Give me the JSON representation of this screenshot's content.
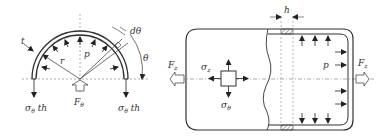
{
  "left_figure": {
    "name": "half-ring-free-body",
    "labels": {
      "t": "t",
      "r": "r",
      "p": "p",
      "dtheta": "dθ",
      "theta": "θ",
      "F_theta": "F",
      "F_theta_sub": "θ",
      "sigma_left": "σ",
      "sigma_left_sub": "θ",
      "sigma_left_suffix": " th",
      "sigma_right": "σ",
      "sigma_right_sub": "θ",
      "sigma_right_suffix": " th"
    }
  },
  "right_figure": {
    "name": "cylinder-section",
    "labels": {
      "h": "h",
      "p": "p",
      "F_z_left": "F",
      "F_z_left_sub": "z",
      "F_z_right": "F",
      "F_z_right_sub": "z",
      "sigma_z": "σ",
      "sigma_z_sub": "z",
      "sigma_theta": "σ",
      "sigma_theta_sub": "θ"
    }
  },
  "colors": {
    "stroke": "#333333",
    "hatch": "#555555",
    "dash": "#777777"
  }
}
